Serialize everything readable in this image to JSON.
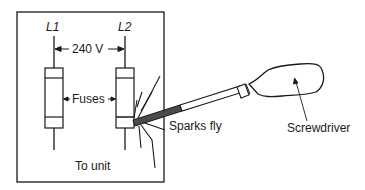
{
  "diagram": {
    "labels": {
      "line1": "L1",
      "line2": "L2",
      "voltage": "240 V",
      "fuses": "Fuses",
      "sparks": "Sparks fly",
      "screwdriver": "Screwdriver",
      "to_unit": "To unit"
    },
    "colors": {
      "stroke": "#1a1a1a",
      "shaft_dark": "#4a4a4a",
      "background": "#ffffff"
    }
  }
}
